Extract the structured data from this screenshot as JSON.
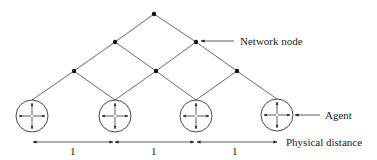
{
  "diagram": {
    "type": "network",
    "labels": {
      "network_node": "Network node",
      "agent": "Agent",
      "physical_distance": "Physical distance"
    },
    "distance_labels": [
      "1",
      "1",
      "1"
    ],
    "nodes": [
      {
        "id": "n0",
        "level": 0,
        "x": 154,
        "y": 14
      },
      {
        "id": "n1",
        "level": 1,
        "x": 115,
        "y": 42
      },
      {
        "id": "n2",
        "level": 1,
        "x": 196,
        "y": 42
      },
      {
        "id": "n3",
        "level": 2,
        "x": 74,
        "y": 71
      },
      {
        "id": "n4",
        "level": 2,
        "x": 156,
        "y": 71
      },
      {
        "id": "n5",
        "level": 2,
        "x": 237,
        "y": 71
      }
    ],
    "agents": [
      {
        "id": "a1",
        "x": 32,
        "y": 116
      },
      {
        "id": "a2",
        "x": 115,
        "y": 116
      },
      {
        "id": "a3",
        "x": 196,
        "y": 116
      },
      {
        "id": "a4",
        "x": 277,
        "y": 115
      }
    ],
    "edges": [
      [
        "n0",
        "n1"
      ],
      [
        "n0",
        "n2"
      ],
      [
        "n1",
        "n3"
      ],
      [
        "n1",
        "n4"
      ],
      [
        "n2",
        "n4"
      ],
      [
        "n2",
        "n5"
      ],
      [
        "n3",
        "a1"
      ],
      [
        "n3",
        "a2"
      ],
      [
        "n4",
        "a2"
      ],
      [
        "n4",
        "a3"
      ],
      [
        "n5",
        "a3"
      ],
      [
        "n5",
        "a4"
      ]
    ]
  }
}
